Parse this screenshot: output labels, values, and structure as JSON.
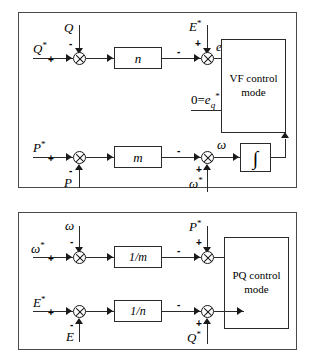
{
  "diagram": {
    "panels": [
      {
        "id": "vf",
        "block_label_line1": "VF control",
        "block_label_line2": "mode",
        "loops": [
          {
            "name": "reactive-power-voltage-loop",
            "inputs": [
              {
                "label": "Q*",
                "sign": "+",
                "entry": "left"
              },
              {
                "label": "Q",
                "sign": "-",
                "entry": "top"
              }
            ],
            "gain": "n",
            "second_sum_inputs": [
              {
                "label": "E*",
                "sign": "+",
                "entry": "top"
              },
              {
                "label": "",
                "sign": "-",
                "entry": "left"
              }
            ],
            "output": "ed*"
          },
          {
            "name": "active-power-frequency-loop",
            "inputs": [
              {
                "label": "P*",
                "sign": "+",
                "entry": "left"
              },
              {
                "label": "P",
                "sign": "-",
                "entry": "bottom"
              }
            ],
            "gain": "m",
            "second_sum_inputs": [
              {
                "label": "omega*",
                "sign": "+",
                "entry": "bottom"
              },
              {
                "label": "",
                "sign": "-",
                "entry": "left"
              }
            ],
            "output": "omega",
            "integrator": "integral"
          }
        ],
        "direct_input": "0=eq*"
      },
      {
        "id": "pq",
        "block_label_line1": "PQ control",
        "block_label_line2": "mode",
        "loops": [
          {
            "name": "frequency-power-loop",
            "inputs": [
              {
                "label": "omega*",
                "sign": "+",
                "entry": "left"
              },
              {
                "label": "omega",
                "sign": "-",
                "entry": "top"
              }
            ],
            "gain": "1/m",
            "second_sum_inputs": [
              {
                "label": "P*",
                "sign": "+",
                "entry": "top"
              },
              {
                "label": "",
                "sign": "-",
                "entry": "left"
              }
            ]
          },
          {
            "name": "voltage-reactive-power-loop",
            "inputs": [
              {
                "label": "E*",
                "sign": "+",
                "entry": "left"
              },
              {
                "label": "E",
                "sign": "-",
                "entry": "bottom"
              }
            ],
            "gain": "1/n",
            "second_sum_inputs": [
              {
                "label": "Q*",
                "sign": "+",
                "entry": "bottom"
              },
              {
                "label": "",
                "sign": "-",
                "entry": "left"
              }
            ]
          }
        ]
      }
    ],
    "labels": {
      "Q": "Q",
      "Q_star_base": "Q",
      "P": "P",
      "P_star_base": "P",
      "E": "E",
      "E_star_base": "E",
      "omega": "ω",
      "omega_star_base": "ω",
      "star": "*",
      "zero_eq": "0=",
      "e_base": "e",
      "d_sub": "d",
      "q_sub": "q",
      "gain_n": "n",
      "gain_m": "m",
      "gain_inv_m": "1/m",
      "gain_inv_n": "1/n",
      "integrator_glyph": "∫",
      "plus": "+",
      "minus": "-",
      "vf_line1": "VF control",
      "vf_line2": "mode",
      "pq_line1": "PQ control",
      "pq_line2": "mode"
    },
    "colors": {
      "line": "#2b2b2b",
      "panel_border": "#4a4a4a",
      "background": "#ffffff"
    }
  }
}
